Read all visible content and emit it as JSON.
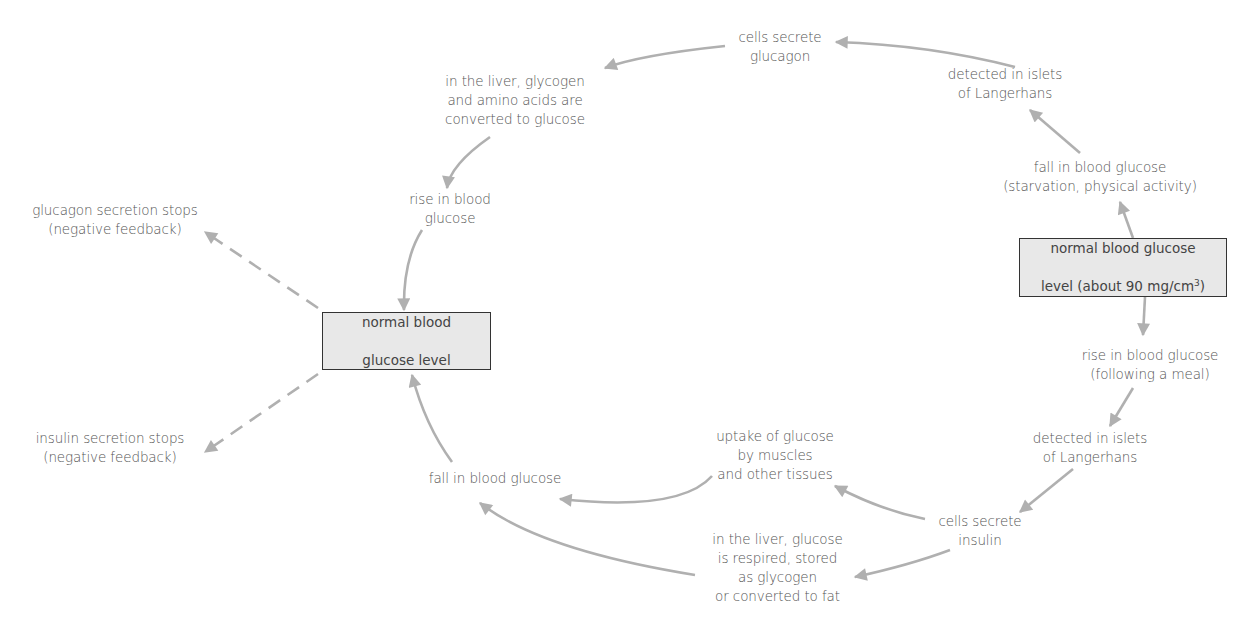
{
  "diagram": {
    "colors": {
      "arrow": "#b0b0b0",
      "box_fill": "#e8e8e8",
      "box_border": "#333333",
      "text": "#555555"
    },
    "left_box": {
      "line1": "normal blood",
      "line2": "glucose level"
    },
    "right_box": {
      "line1": "normal blood glucose",
      "line2_prefix": "level (about 90 mg/cm",
      "line2_sup": "3",
      "line2_suffix": ")"
    },
    "glucagon_pathway": {
      "fall": "fall in blood glucose\n(starvation, physical activity)",
      "detected": "detected in islets\nof Langerhans",
      "secrete": "cells secrete\nglucagon",
      "liver": "in the liver, glycogen\nand amino acids are\nconverted to glucose",
      "rise": "rise in blood\nglucose"
    },
    "insulin_pathway": {
      "rise": "rise in blood glucose\n(following a meal)",
      "detected": "detected in islets\nof Langerhans",
      "secrete": "cells secrete\ninsulin",
      "uptake": "uptake of glucose\nby muscles\nand other tissues",
      "liver": "in the liver, glucose\nis respired, stored\nas glycogen\nor converted to fat",
      "fall": "fall in blood glucose"
    },
    "feedback": {
      "glucagon_stops": "glucagon secretion stops\n(negative feedback)",
      "insulin_stops": "insulin secretion stops\n(negative feedback)"
    }
  }
}
